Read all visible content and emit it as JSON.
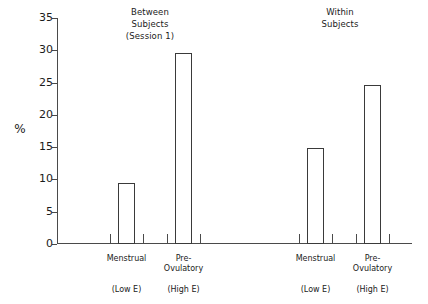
{
  "chart_data": {
    "type": "bar",
    "title": "",
    "xlabel": "",
    "ylabel": "%",
    "ylim": [
      0,
      35
    ],
    "yticks": [
      0,
      5,
      10,
      15,
      20,
      25,
      30,
      35
    ],
    "grid": false,
    "legend": "none",
    "groups": [
      {
        "name": "between-subjects",
        "title_lines": [
          "Between",
          "Subjects",
          "(Session 1)"
        ],
        "categories": [
          "Menstrual",
          "Pre-Ovulatory"
        ],
        "category_lines": [
          [
            "Menstrual"
          ],
          [
            "Pre-",
            "Ovulatory"
          ]
        ],
        "sublabels": [
          "(Low E)",
          "(High E)"
        ],
        "values": [
          9.4,
          29.6
        ]
      },
      {
        "name": "within-subjects",
        "title_lines": [
          "Within",
          "Subjects"
        ],
        "categories": [
          "Menstrual",
          "Pre-Ovulatory"
        ],
        "category_lines": [
          [
            "Menstrual"
          ],
          [
            "Pre-",
            "Ovulatory"
          ]
        ],
        "sublabels": [
          "(Low E)",
          "(High E)"
        ],
        "values": [
          14.8,
          24.7
        ]
      }
    ],
    "categories": [
      "Menstrual",
      "Pre-Ovulatory",
      "Menstrual",
      "Pre-Ovulatory"
    ],
    "values": [
      9.4,
      29.6,
      14.8,
      24.7
    ],
    "colors": {
      "bar_fill": "#ffffff",
      "bar_edge": "#3a3a3a",
      "axis": "#4a4a4a",
      "text": "#1b1b1b",
      "background": "#ffffff"
    }
  }
}
